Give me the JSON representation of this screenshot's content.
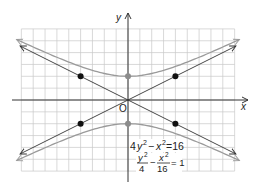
{
  "chart_data": {
    "type": "line",
    "title": "",
    "xlabel": "x",
    "ylabel": "y",
    "origin_label": "O",
    "xlim": [
      -9,
      9
    ],
    "ylim": [
      -6,
      6
    ],
    "grid": true,
    "grid_step": 1,
    "colors": {
      "grid": "#c8c8c8",
      "axis": "#333333",
      "hyperbola": "#9a9a9a",
      "asymptote": "#333333",
      "point": "#111111",
      "vertex": "#8c8c8c"
    },
    "series": [
      {
        "name": "hyperbola",
        "equation": "4y^2 - x^2 = 16",
        "form": "y^2/4 - x^2/16 = 1",
        "a": 2,
        "b": 4,
        "orientation": "vertical"
      },
      {
        "name": "asymptote-positive",
        "slope": 0.5,
        "intercept": 0
      },
      {
        "name": "asymptote-negative",
        "slope": -0.5,
        "intercept": 0
      }
    ],
    "points": [
      {
        "name": "box-corner",
        "x": -4,
        "y": 2
      },
      {
        "name": "box-corner",
        "x": 4,
        "y": 2
      },
      {
        "name": "box-corner",
        "x": -4,
        "y": -2
      },
      {
        "name": "box-corner",
        "x": 4,
        "y": -2
      }
    ],
    "vertices": [
      {
        "name": "vertex",
        "x": 0,
        "y": 2
      },
      {
        "name": "vertex",
        "x": 0,
        "y": -2
      }
    ],
    "annotations": {
      "equation1": {
        "lhs_a": "4",
        "var_y": "y",
        "exp": "2",
        "minus": "−",
        "var_x": "x",
        "rhs": "=16"
      },
      "equation2": {
        "num1": "y",
        "num1_exp": "2",
        "den1": "4",
        "minus": "−",
        "num2": "x",
        "num2_exp": "2",
        "den2": "16",
        "rhs": "= 1"
      }
    }
  }
}
